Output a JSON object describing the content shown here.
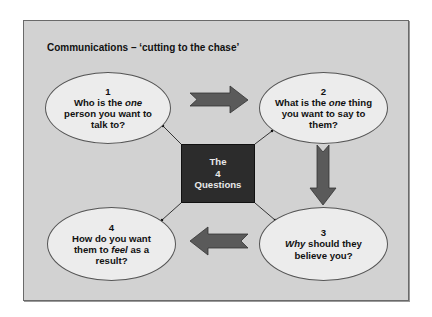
{
  "title": "Communications – ‘cutting to the chase’",
  "center": {
    "line1": "The",
    "line2": "4",
    "line3": "Questions"
  },
  "questions": [
    {
      "number": "1",
      "parts": [
        {
          "text": "Who is the ",
          "italic": false
        },
        {
          "text": "one",
          "italic": true
        },
        {
          "text": " person you want to talk to?",
          "italic": false
        }
      ],
      "line1_pre": "Who is the ",
      "line1_em": "one",
      "line2": "person you want to",
      "line3": "talk to?"
    },
    {
      "number": "2",
      "line1_pre": "What is the ",
      "line1_em": "one",
      "line1_post": " thing",
      "line2": "you want to say to",
      "line3": "them?"
    },
    {
      "number": "3",
      "line1_em": "Why",
      "line1_post": " should they",
      "line2": "believe you?"
    },
    {
      "number": "4",
      "line1": "How do you want",
      "line2_pre": "them to ",
      "line2_em": "feel",
      "line2_post": " as a",
      "line3": "result?"
    }
  ],
  "colors": {
    "frame_bg": "#d2d2d2",
    "ellipse_bg": "#ececec",
    "arrow_fill": "#5a5a5a",
    "center_bg": "#2c2c2c",
    "center_text": "#e8e8e8"
  }
}
